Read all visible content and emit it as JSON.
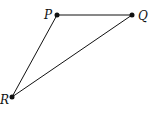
{
  "diagram": {
    "type": "triangle",
    "points": [
      {
        "id": "P",
        "label": "P",
        "x": 57,
        "y": 15,
        "label_x": 44,
        "label_y": 19
      },
      {
        "id": "Q",
        "label": "Q",
        "x": 132,
        "y": 15,
        "label_x": 138,
        "label_y": 20
      },
      {
        "id": "R",
        "label": "R",
        "x": 12,
        "y": 97,
        "label_x": 0,
        "label_y": 104
      }
    ],
    "edges": [
      {
        "from": "P",
        "to": "Q"
      },
      {
        "from": "P",
        "to": "R"
      },
      {
        "from": "Q",
        "to": "R"
      }
    ],
    "stroke_color": "#111111"
  }
}
